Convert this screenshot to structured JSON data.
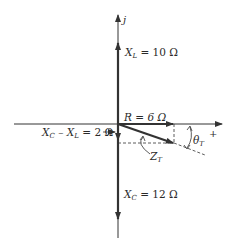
{
  "diagram": {
    "axes": {
      "imaginary_label": "j",
      "real_label": "+"
    },
    "labels": {
      "xl": {
        "var": "X",
        "sub": "L",
        "rest": " = 10 Ω"
      },
      "r": {
        "text": "R = 6 Ω"
      },
      "xc_minus_xl": {
        "var1": "X",
        "sub1": "C",
        "mid": " – X",
        "sub2": "L",
        "rest": " = 2 Ω"
      },
      "zt": {
        "var": "Z",
        "sub": "T"
      },
      "theta": {
        "var": "θ",
        "sub": "T"
      },
      "xc": {
        "var": "X",
        "sub": "C",
        "rest": " = 12 Ω"
      }
    },
    "values": {
      "X_L_ohms": 10,
      "R_ohms": 6,
      "X_C_minus_X_L_ohms": 2,
      "X_C_ohms": 12
    },
    "colors": {
      "line": "#333333",
      "text": "#2a2a2a",
      "background": "#ffffff"
    }
  }
}
